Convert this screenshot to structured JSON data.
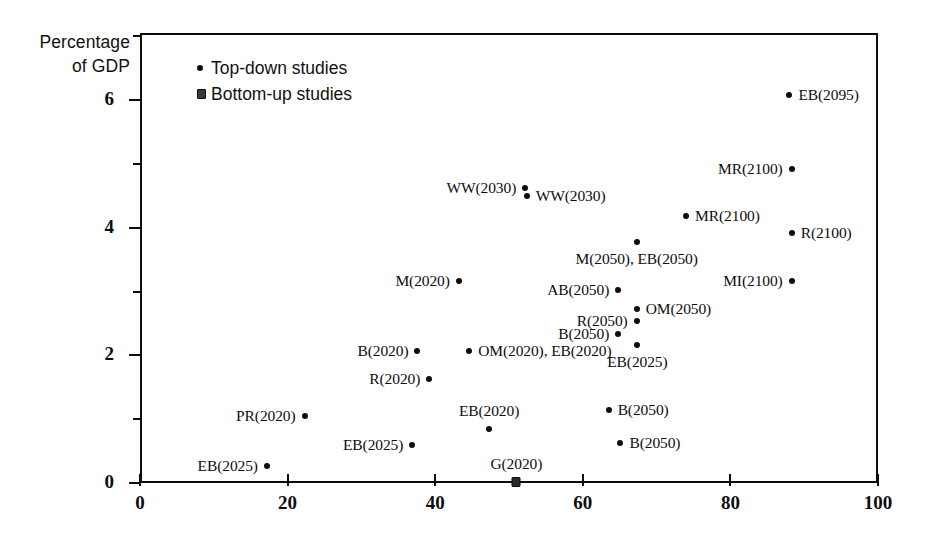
{
  "chart_data": {
    "type": "scatter",
    "title": "",
    "xlabel": "",
    "ylabel": "Percentage of GDP",
    "xlim": [
      0,
      100
    ],
    "ylim": [
      0,
      7.05
    ],
    "grid": false,
    "xticks": [
      "0",
      "20",
      "40",
      "60",
      "80",
      "100"
    ],
    "xtick_values": [
      0,
      20,
      40,
      60,
      80,
      100
    ],
    "yticks": [
      "0",
      "2",
      "4",
      "6"
    ],
    "ytick_values": [
      0,
      2,
      4,
      6
    ],
    "yminor_values": [
      1,
      3,
      5,
      7
    ],
    "legend_position": "upper-left-inside",
    "series": [
      {
        "name": "Top-down studies",
        "marker": "circle",
        "points": [
          {
            "label": "EB(2095)",
            "x": 88.0,
            "y": 6.08,
            "label_side": "right"
          },
          {
            "label": "MR(2100)",
            "x": 88.3,
            "y": 4.92,
            "label_side": "left"
          },
          {
            "label": "WW(2030)",
            "x": 52.2,
            "y": 4.62,
            "label_side": "left"
          },
          {
            "label": "WW(2030)",
            "x": 52.4,
            "y": 4.5,
            "label_side": "right"
          },
          {
            "label": "MR(2100)",
            "x": 74.0,
            "y": 4.18,
            "label_side": "right"
          },
          {
            "label": "R(2100)",
            "x": 88.3,
            "y": 3.92,
            "label_side": "right"
          },
          {
            "label": "M(2050), EB(2050)",
            "x": 67.3,
            "y": 3.78,
            "label_side": "below"
          },
          {
            "label": "M(2020)",
            "x": 43.2,
            "y": 3.16,
            "label_side": "left"
          },
          {
            "label": "MI(2100)",
            "x": 88.3,
            "y": 3.16,
            "label_side": "left"
          },
          {
            "label": "AB(2050)",
            "x": 64.8,
            "y": 3.02,
            "label_side": "left"
          },
          {
            "label": "OM(2050)",
            "x": 67.3,
            "y": 2.72,
            "label_side": "right"
          },
          {
            "label": "R(2050)",
            "x": 67.3,
            "y": 2.54,
            "label_side": "left"
          },
          {
            "label": "B(2050)",
            "x": 64.8,
            "y": 2.33,
            "label_side": "left"
          },
          {
            "label": "EB(2025)",
            "x": 67.4,
            "y": 2.16,
            "label_side": "below"
          },
          {
            "label": "OM(2020), EB(2020)",
            "x": 44.6,
            "y": 2.07,
            "label_side": "right"
          },
          {
            "label": "B(2020)",
            "x": 37.6,
            "y": 2.07,
            "label_side": "left"
          },
          {
            "label": "R(2020)",
            "x": 39.2,
            "y": 1.63,
            "label_side": "left"
          },
          {
            "label": "B(2050)",
            "x": 63.5,
            "y": 1.15,
            "label_side": "right"
          },
          {
            "label": "PR(2020)",
            "x": 22.3,
            "y": 1.05,
            "label_side": "left"
          },
          {
            "label": "EB(2020)",
            "x": 47.3,
            "y": 0.85,
            "label_side": "above"
          },
          {
            "label": "B(2050)",
            "x": 65.1,
            "y": 0.63,
            "label_side": "right"
          },
          {
            "label": "EB(2025)",
            "x": 36.9,
            "y": 0.6,
            "label_side": "left"
          },
          {
            "label": "EB(2025)",
            "x": 17.2,
            "y": 0.26,
            "label_side": "left"
          }
        ]
      },
      {
        "name": "Bottom-up studies",
        "marker": "square",
        "points": [
          {
            "label": "G(2020)",
            "x": 51.0,
            "y": 0.02,
            "label_side": "above"
          }
        ]
      }
    ]
  },
  "legend": {
    "items": [
      {
        "label": "Top-down studies",
        "marker": "circle"
      },
      {
        "label": "Bottom-up studies",
        "marker": "square"
      }
    ]
  },
  "colors": {
    "ink": "#0d0d0d",
    "background": "#ffffff"
  }
}
